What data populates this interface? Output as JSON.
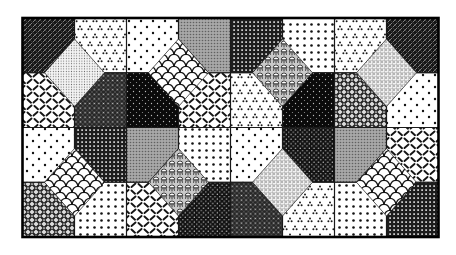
{
  "figure": {
    "type": "octagon-square-tessellation",
    "canvas": {
      "width": 456,
      "height": 255,
      "background": "#ffffff"
    },
    "frame": {
      "left": 22.5,
      "top": 18,
      "columns": 8,
      "rows": 4,
      "cell_width": 52,
      "cell_height": 54.75,
      "grid_line_color": "#1a1a1a",
      "grid_line_width": 1.2,
      "border_color": "#000000",
      "border_width": 2.6
    },
    "octagon_cut": {
      "x": 30,
      "y": 33.75
    },
    "patterns": {
      "dark-crosshatch": "dense dark diagonal weave",
      "triangles": "white with sparse small dot-triangle marks",
      "dots-sparse": "white with sparse staggered dots",
      "gray": "medium gray halftone",
      "grid-mesh": "dark window-screen mesh with white pinholes",
      "dots-medium": "white with medium polka-dot grid",
      "diag-dash": "white with short diagonal dashes",
      "fine-stipple": "light fine stipple",
      "scales": "white fish-scale scallops",
      "pine": "dense white fans with dark stems",
      "waffle": "light woven check with dark dots",
      "dark-weave": "dark crosshatch weave with light dot lattice",
      "black-speckle": "near-black with sparse white specks",
      "dark-dots": "near-black with regular white dot grid",
      "argyle": "bold diamond lattice with light dot crossings"
    },
    "cells": [
      [
        "dark-crosshatch",
        "triangles",
        "dots-sparse",
        "gray",
        "grid-mesh",
        "dots-medium",
        "triangles",
        "dark-crosshatch"
      ],
      [
        "diag-dash",
        "dark-weave",
        "black-speckle",
        "diag-dash",
        "triangles",
        "black-speckle",
        "argyle",
        "dots-sparse"
      ],
      [
        "dots-sparse",
        "grid-mesh",
        "gray",
        "dots-medium",
        "dots-sparse",
        "dark-dots",
        "gray",
        "diag-dash"
      ],
      [
        "argyle",
        "dots-medium",
        "diag-dash",
        "dark-dots",
        "dark-weave",
        "triangles",
        "dots-medium",
        "grid-mesh"
      ]
    ],
    "octagons": [
      {
        "at": [
          0,
          0
        ],
        "quadrants": {
          "br": "dark-crosshatch"
        }
      },
      {
        "at": [
          4,
          0
        ],
        "quadrants": {
          "bl": "gray",
          "br": "grid-mesh"
        }
      },
      {
        "at": [
          8,
          0
        ],
        "quadrants": {
          "bl": "dark-crosshatch"
        }
      },
      {
        "at": [
          2,
          2
        ],
        "quadrants": {
          "tl": "dark-weave",
          "tr": "black-speckle",
          "bl": "grid-mesh",
          "br": "gray"
        }
      },
      {
        "at": [
          6,
          2
        ],
        "quadrants": {
          "tl": "black-speckle",
          "tr": "argyle",
          "bl": "dark-dots",
          "br": "gray"
        }
      },
      {
        "at": [
          0,
          4
        ],
        "quadrants": {
          "tr": "argyle"
        }
      },
      {
        "at": [
          4,
          4
        ],
        "quadrants": {
          "tl": "dark-dots",
          "tr": "dark-weave"
        }
      },
      {
        "at": [
          8,
          4
        ],
        "quadrants": {
          "tl": "grid-mesh"
        }
      }
    ],
    "diamonds": [
      {
        "at": [
          1,
          1
        ],
        "pattern": "fine-stipple"
      },
      {
        "at": [
          3,
          1
        ],
        "pattern": "scales"
      },
      {
        "at": [
          5,
          1
        ],
        "pattern": "pine"
      },
      {
        "at": [
          7,
          1
        ],
        "pattern": "waffle"
      },
      {
        "at": [
          1,
          3
        ],
        "pattern": "scales"
      },
      {
        "at": [
          3,
          3
        ],
        "pattern": "pine"
      },
      {
        "at": [
          5,
          3
        ],
        "pattern": "waffle"
      },
      {
        "at": [
          7,
          3
        ],
        "pattern": "scales"
      }
    ]
  }
}
